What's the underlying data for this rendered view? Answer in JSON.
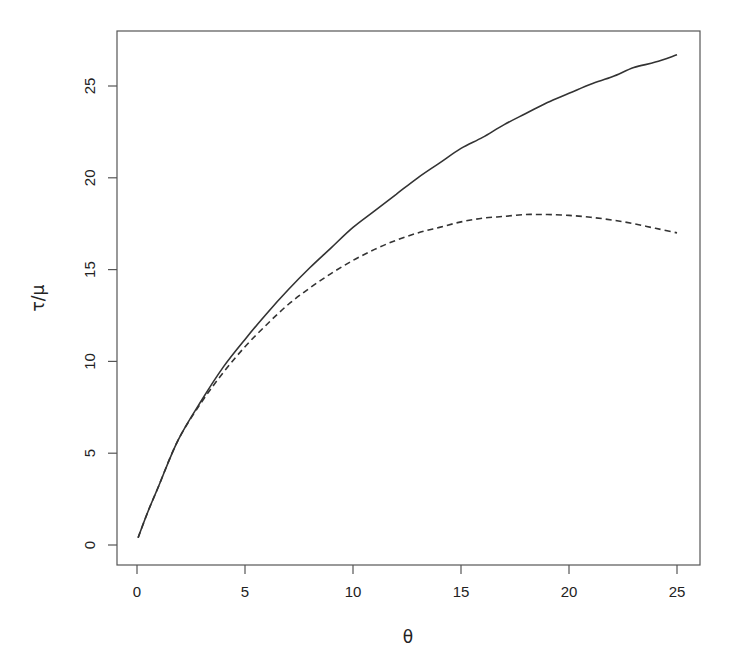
{
  "chart_data": {
    "type": "line",
    "title": "",
    "xlabel": "θ",
    "ylabel": "τ/μ",
    "xlim": [
      0,
      25
    ],
    "ylim": [
      0,
      27
    ],
    "xticks": [
      0,
      5,
      10,
      15,
      20,
      25
    ],
    "yticks": [
      0,
      5,
      10,
      15,
      20,
      25
    ],
    "grid": false,
    "legend": null,
    "series": [
      {
        "name": "solid",
        "style": "solid",
        "color": "#333333",
        "x": [
          0.05,
          0.5,
          1,
          1.9,
          3,
          4,
          5,
          6,
          7,
          8,
          9,
          10,
          11,
          12,
          13,
          14,
          15,
          16,
          17,
          18,
          19,
          20,
          21,
          22,
          23,
          24,
          25
        ],
        "y": [
          0.4,
          1.8,
          3.2,
          5.7,
          7.9,
          9.7,
          11.2,
          12.6,
          13.9,
          15.1,
          16.2,
          17.3,
          18.2,
          19.1,
          20.0,
          20.8,
          21.6,
          22.2,
          22.9,
          23.5,
          24.1,
          24.6,
          25.1,
          25.5,
          26.0,
          26.3,
          26.7
        ]
      },
      {
        "name": "dashed",
        "style": "dashed",
        "color": "#333333",
        "x": [
          0.05,
          0.5,
          1,
          1.9,
          3,
          4,
          5,
          6,
          7,
          8,
          9,
          10,
          11,
          12,
          13,
          14,
          15,
          16,
          17,
          18,
          18.5,
          19,
          20,
          21,
          22,
          23,
          24,
          25
        ],
        "y": [
          0.4,
          1.8,
          3.2,
          5.7,
          7.8,
          9.4,
          10.8,
          12.0,
          13.1,
          14.0,
          14.8,
          15.5,
          16.1,
          16.6,
          17.0,
          17.3,
          17.6,
          17.8,
          17.9,
          18.0,
          18.0,
          18.0,
          17.95,
          17.85,
          17.7,
          17.5,
          17.25,
          17.0
        ]
      }
    ]
  },
  "layout": {
    "plot_box": {
      "left": 117,
      "top": 31,
      "right": 700,
      "bottom": 565
    },
    "x_map": {
      "v0": 0,
      "px0": 137,
      "v1": 25,
      "px1": 677
    },
    "y_map": {
      "v0": 0,
      "px0": 545,
      "v1": 25,
      "px1": 86
    }
  }
}
